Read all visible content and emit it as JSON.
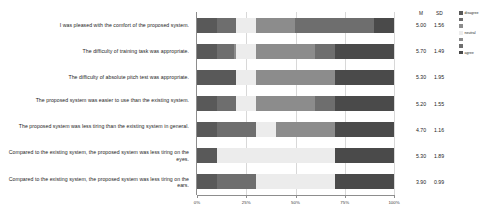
{
  "chart_data": {
    "type": "bar",
    "subtype": "stacked-horizontal-likert",
    "title": "",
    "xlabel": "",
    "ylabel": "",
    "xlim": [
      0,
      100
    ],
    "xticks": [
      "0%",
      "25%",
      "50%",
      "75%",
      "100%"
    ],
    "xtick_values": [
      0,
      25,
      50,
      75,
      100
    ],
    "grid": true,
    "legend_position": "right",
    "scale_points": 7,
    "legend": [
      {
        "label": "disagree",
        "color": "#595959"
      },
      {
        "label": "",
        "color": "#6e6e6e"
      },
      {
        "label": "",
        "color": "#8c8c8c"
      },
      {
        "label": "neutral",
        "color": "#ececec"
      },
      {
        "label": "",
        "color": "#8c8c8c"
      },
      {
        "label": "",
        "color": "#6e6e6e"
      },
      {
        "label": "agree",
        "color": "#4a4a4a"
      }
    ],
    "stats_headers": {
      "mean": "M",
      "sd": "SD"
    },
    "categories": [
      "I was pleased with the comfort of the proposed system.",
      "The difficulty of training task was appropriate.",
      "The difficulty of absolute pitch test was appropriate.",
      "The proposed system was easier to use than the existing system.",
      "The proposed system was less tiring than the existing system in general.",
      "Compared to the existing system, the proposed system was less tiring on the eyes.",
      "Compared to the existing system, the proposed system was less tiring on the ears."
    ],
    "series": [
      {
        "name": "strongly disagree",
        "color": "#595959",
        "values": [
          10,
          10,
          20,
          10,
          10,
          10,
          10
        ]
      },
      {
        "name": "disagree",
        "color": "#6e6e6e",
        "values": [
          10,
          9,
          0,
          10,
          20,
          0,
          20
        ]
      },
      {
        "name": "slightly disagree",
        "color": "#8c8c8c",
        "values": [
          0,
          1,
          0,
          0,
          0,
          0,
          0
        ]
      },
      {
        "name": "neutral",
        "color": "#ececec",
        "values": [
          10,
          10,
          10,
          10,
          10,
          60,
          40
        ]
      },
      {
        "name": "slightly agree",
        "color": "#8c8c8c",
        "values": [
          20,
          30,
          40,
          30,
          30,
          0,
          0
        ]
      },
      {
        "name": "agree",
        "color": "#6e6e6e",
        "values": [
          40,
          10,
          0,
          10,
          0,
          0,
          0
        ]
      },
      {
        "name": "strongly agree",
        "color": "#4a4a4a",
        "values": [
          10,
          30,
          30,
          30,
          30,
          30,
          30
        ]
      }
    ],
    "stats": [
      {
        "mean": "5.00",
        "sd": "1.56"
      },
      {
        "mean": "5.70",
        "sd": "1.49"
      },
      {
        "mean": "5.30",
        "sd": "1.95"
      },
      {
        "mean": "5.20",
        "sd": "1.55"
      },
      {
        "mean": "4.70",
        "sd": "1.16"
      },
      {
        "mean": "5.30",
        "sd": "1.89"
      },
      {
        "mean": "3.90",
        "sd": "0.99"
      }
    ]
  }
}
